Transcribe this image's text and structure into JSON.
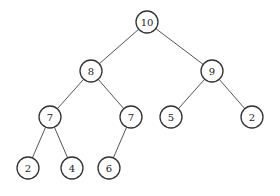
{
  "diagram": {
    "type": "binary-tree",
    "node_radius": 11,
    "nodes": [
      {
        "id": "n10",
        "label": "10",
        "x": 147,
        "y": 22
      },
      {
        "id": "n8",
        "label": "8",
        "x": 91,
        "y": 71
      },
      {
        "id": "n9",
        "label": "9",
        "x": 212,
        "y": 71
      },
      {
        "id": "n7a",
        "label": "7",
        "x": 50,
        "y": 117
      },
      {
        "id": "n7b",
        "label": "7",
        "x": 131,
        "y": 117
      },
      {
        "id": "n5",
        "label": "5",
        "x": 171,
        "y": 117
      },
      {
        "id": "n2a",
        "label": "2",
        "x": 252,
        "y": 117
      },
      {
        "id": "n2b",
        "label": "2",
        "x": 28,
        "y": 168
      },
      {
        "id": "n4",
        "label": "4",
        "x": 72,
        "y": 168
      },
      {
        "id": "n6",
        "label": "6",
        "x": 109,
        "y": 168
      }
    ],
    "edges": [
      {
        "from": "n10",
        "to": "n8"
      },
      {
        "from": "n10",
        "to": "n9"
      },
      {
        "from": "n8",
        "to": "n7a"
      },
      {
        "from": "n8",
        "to": "n7b"
      },
      {
        "from": "n9",
        "to": "n5"
      },
      {
        "from": "n9",
        "to": "n2a"
      },
      {
        "from": "n7a",
        "to": "n2b"
      },
      {
        "from": "n7a",
        "to": "n4"
      },
      {
        "from": "n7b",
        "to": "n6"
      }
    ]
  }
}
